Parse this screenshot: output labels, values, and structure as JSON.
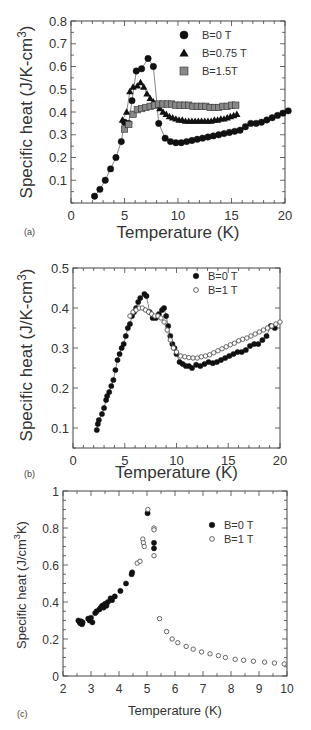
{
  "chart_data": [
    {
      "id": "a",
      "type": "scatter",
      "panel_label": "(a)",
      "title": "",
      "xlabel": "Temperature (K)",
      "ylabel": "Specific heat (J/K-cm",
      "ylabel_sup": "3",
      "ylabel_tail": ")",
      "xlim": [
        0,
        20
      ],
      "ylim": [
        0,
        0.8
      ],
      "xticks": [
        0,
        5,
        10,
        15,
        20
      ],
      "yticks": [
        0.1,
        0.2,
        0.3,
        0.4,
        0.5,
        0.6,
        0.7,
        0.8
      ],
      "legend_position": "upper right",
      "grid": false,
      "series": [
        {
          "name": "B=0 T",
          "marker": "circle",
          "fill": "#111111",
          "connected": true,
          "x": [
            2.2,
            2.7,
            3.2,
            3.7,
            4.2,
            4.7,
            5.0,
            5.4,
            5.7,
            6.1,
            6.6,
            7.2,
            7.7,
            8.2,
            8.8,
            9.3,
            9.8,
            10.3,
            10.8,
            11.3,
            11.8,
            12.3,
            12.8,
            13.3,
            13.8,
            14.3,
            14.8,
            15.3,
            15.8,
            16.3,
            16.8,
            17.3,
            17.8,
            18.3,
            18.8,
            19.3,
            19.8,
            20.3
          ],
          "y": [
            0.03,
            0.06,
            0.1,
            0.15,
            0.2,
            0.27,
            0.355,
            0.35,
            0.45,
            0.58,
            0.59,
            0.635,
            0.6,
            0.35,
            0.285,
            0.27,
            0.265,
            0.265,
            0.27,
            0.275,
            0.28,
            0.285,
            0.29,
            0.295,
            0.3,
            0.305,
            0.31,
            0.315,
            0.32,
            0.335,
            0.35,
            0.35,
            0.355,
            0.365,
            0.375,
            0.385,
            0.395,
            0.405
          ]
        },
        {
          "name": "B=0.75 T",
          "marker": "triangle",
          "fill": "#111111",
          "connected": true,
          "x": [
            4.8,
            5.2,
            5.5,
            5.8,
            6.2,
            6.5,
            6.8,
            7.1,
            7.4,
            7.7,
            8.0,
            8.3,
            8.6,
            8.9,
            9.2,
            9.5,
            9.8,
            10.1,
            10.4,
            10.7,
            11.0,
            11.3,
            11.6,
            11.9,
            12.2,
            12.5,
            12.8,
            13.1,
            13.4,
            13.7,
            14.0,
            14.3,
            14.6,
            14.9,
            15.2,
            15.5
          ],
          "y": [
            0.365,
            0.4,
            0.49,
            0.51,
            0.515,
            0.53,
            0.51,
            0.48,
            0.46,
            0.445,
            0.43,
            0.415,
            0.4,
            0.39,
            0.38,
            0.375,
            0.37,
            0.365,
            0.365,
            0.36,
            0.36,
            0.36,
            0.36,
            0.36,
            0.36,
            0.36,
            0.36,
            0.36,
            0.365,
            0.365,
            0.37,
            0.37,
            0.375,
            0.38,
            0.385,
            0.39
          ]
        },
        {
          "name": "B=1.5T",
          "marker": "square",
          "fill": "#888888",
          "connected": false,
          "x": [
            5.0,
            5.4,
            5.8,
            6.2,
            6.6,
            7.0,
            7.4,
            7.8,
            8.2,
            8.6,
            9.0,
            9.4,
            9.8,
            10.2,
            10.6,
            11.0,
            11.4,
            11.8,
            12.2,
            12.6,
            13.0,
            13.4,
            13.8,
            14.2,
            14.6,
            15.0,
            15.4
          ],
          "y": [
            0.325,
            0.345,
            0.39,
            0.41,
            0.415,
            0.42,
            0.425,
            0.43,
            0.435,
            0.435,
            0.435,
            0.435,
            0.43,
            0.43,
            0.43,
            0.43,
            0.425,
            0.425,
            0.425,
            0.425,
            0.42,
            0.42,
            0.42,
            0.425,
            0.425,
            0.43,
            0.43
          ]
        }
      ]
    },
    {
      "id": "b",
      "type": "scatter",
      "panel_label": "(b)",
      "title": "",
      "xlabel": "Temperature (K)",
      "ylabel": "Specific heat (J/K-cm",
      "ylabel_sup": "3",
      "ylabel_tail": ")",
      "xlim": [
        0,
        20
      ],
      "ylim": [
        0.05,
        0.5
      ],
      "xticks": [
        0,
        5,
        10,
        15,
        20
      ],
      "yticks": [
        0.1,
        0.2,
        0.3,
        0.4,
        0.5
      ],
      "legend_position": "upper right",
      "grid": false,
      "series": [
        {
          "name": "B=0 T",
          "marker": "circle",
          "fill": "#111111",
          "connected": true,
          "x": [
            2.3,
            2.4,
            2.5,
            2.8,
            3.0,
            3.2,
            3.3,
            3.5,
            3.7,
            3.9,
            4.1,
            4.3,
            4.5,
            4.7,
            4.9,
            5.1,
            5.3,
            5.5,
            5.7,
            5.9,
            6.1,
            6.3,
            6.5,
            6.9,
            7.1,
            7.4,
            7.7,
            8.0,
            8.3,
            8.6,
            8.8,
            9.0,
            9.2,
            9.4,
            9.6,
            9.8,
            10.0,
            10.3,
            10.6,
            10.9,
            11.2,
            11.5,
            11.9,
            12.3,
            12.7,
            13.1,
            13.5,
            13.9,
            14.3,
            14.7,
            15.1,
            15.5,
            15.9,
            16.3,
            16.7,
            17.1,
            17.5,
            17.9,
            18.3,
            18.7,
            19.1,
            19.5
          ],
          "y": [
            0.095,
            0.11,
            0.12,
            0.135,
            0.15,
            0.17,
            0.18,
            0.19,
            0.205,
            0.22,
            0.245,
            0.27,
            0.285,
            0.3,
            0.31,
            0.33,
            0.35,
            0.36,
            0.38,
            0.39,
            0.4,
            0.415,
            0.425,
            0.435,
            0.43,
            0.39,
            0.375,
            0.375,
            0.385,
            0.395,
            0.4,
            0.38,
            0.355,
            0.33,
            0.31,
            0.3,
            0.285,
            0.265,
            0.26,
            0.255,
            0.255,
            0.25,
            0.258,
            0.255,
            0.26,
            0.265,
            0.262,
            0.265,
            0.27,
            0.275,
            0.28,
            0.285,
            0.29,
            0.29,
            0.295,
            0.305,
            0.31,
            0.31,
            0.32,
            0.33,
            0.355,
            0.35
          ]
        },
        {
          "name": "B=1 T",
          "marker": "open-circle",
          "fill": "#ffffff",
          "connected": true,
          "x": [
            5.5,
            5.8,
            6.1,
            6.4,
            6.7,
            7.0,
            7.3,
            7.6,
            7.9,
            8.2,
            8.5,
            8.8,
            9.1,
            9.4,
            9.7,
            10.0,
            10.4,
            10.8,
            11.2,
            11.6,
            12.0,
            12.4,
            12.8,
            13.2,
            13.6,
            14.0,
            14.4,
            14.8,
            15.2,
            15.6,
            16.0,
            16.4,
            16.8,
            17.2,
            17.6,
            18.0,
            18.4,
            18.8,
            19.2,
            19.6,
            20.0
          ],
          "y": [
            0.38,
            0.39,
            0.395,
            0.4,
            0.4,
            0.395,
            0.39,
            0.385,
            0.38,
            0.38,
            0.375,
            0.365,
            0.345,
            0.32,
            0.3,
            0.29,
            0.28,
            0.278,
            0.276,
            0.275,
            0.275,
            0.278,
            0.28,
            0.283,
            0.288,
            0.293,
            0.298,
            0.303,
            0.308,
            0.312,
            0.318,
            0.322,
            0.325,
            0.33,
            0.335,
            0.34,
            0.345,
            0.35,
            0.355,
            0.36,
            0.365
          ]
        }
      ]
    },
    {
      "id": "c",
      "type": "scatter",
      "panel_label": "(c)",
      "title": "",
      "xlabel": "Temperature (K)",
      "ylabel": "Specific heat (J/cm",
      "ylabel_sup": "3",
      "ylabel_tail": "K)",
      "xlim": [
        2,
        10
      ],
      "ylim": [
        0,
        1
      ],
      "xticks": [
        2,
        3,
        4,
        5,
        6,
        7,
        8,
        9,
        10
      ],
      "yticks": [
        0,
        0.2,
        0.4,
        0.6,
        0.8,
        1
      ],
      "legend_position": "upper right",
      "grid": false,
      "series": [
        {
          "name": "B=0 T",
          "marker": "circle",
          "fill": "#111111",
          "connected": false,
          "x": [
            2.55,
            2.6,
            2.62,
            2.65,
            2.68,
            2.7,
            2.9,
            2.95,
            3.0,
            3.05,
            3.15,
            3.2,
            3.3,
            3.35,
            3.4,
            3.45,
            3.5,
            3.55,
            3.6,
            3.7,
            3.75,
            3.85,
            4.05,
            4.25,
            4.45,
            4.47,
            5.02,
            5.25,
            5.25
          ],
          "y": [
            0.3,
            0.29,
            0.285,
            0.295,
            0.28,
            0.29,
            0.31,
            0.3,
            0.315,
            0.29,
            0.34,
            0.35,
            0.36,
            0.37,
            0.38,
            0.37,
            0.39,
            0.38,
            0.4,
            0.42,
            0.41,
            0.43,
            0.46,
            0.5,
            0.55,
            0.56,
            0.88,
            0.72,
            0.69
          ]
        },
        {
          "name": "B=1 T",
          "marker": "open-circle",
          "fill": "#ffffff",
          "connected": false,
          "x": [
            4.65,
            4.75,
            4.85,
            4.87,
            4.9,
            5.03,
            5.25,
            5.25,
            5.25,
            5.45,
            5.7,
            5.9,
            6.1,
            6.4,
            6.65,
            6.95,
            7.25,
            7.55,
            7.8,
            8.15,
            8.45,
            8.8,
            9.2,
            9.55,
            9.9
          ],
          "y": [
            0.61,
            0.62,
            0.74,
            0.72,
            0.7,
            0.9,
            0.8,
            0.79,
            0.65,
            0.31,
            0.24,
            0.2,
            0.18,
            0.16,
            0.145,
            0.13,
            0.12,
            0.11,
            0.1,
            0.09,
            0.085,
            0.08,
            0.075,
            0.07,
            0.065
          ]
        }
      ]
    }
  ],
  "layout_labels": {
    "panel_a": "(a)",
    "panel_b": "(b)",
    "panel_c": "(c)"
  }
}
